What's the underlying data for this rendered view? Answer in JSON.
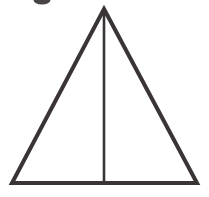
{
  "figure": {
    "title": "Isosceles triangle with vertical median line",
    "canvas": {
      "width": 209,
      "height": 197,
      "background_color": "#ffffff"
    },
    "stroke_color": "#3a3434",
    "shapes": {
      "triangle": {
        "name": "triangle-outline",
        "kind": "polygon",
        "points": "104,9 197,183 12,183",
        "stroke_width": 4,
        "fill": "none",
        "vertices": {
          "apex": {
            "x": 104,
            "y": 9
          },
          "bottom_right": {
            "x": 197,
            "y": 183
          },
          "bottom_left": {
            "x": 12,
            "y": 183
          }
        }
      },
      "median": {
        "name": "median-line",
        "kind": "line",
        "x1": 104,
        "y1": 10,
        "x2": 104,
        "y2": 182,
        "stroke_width": 2.6
      },
      "scan_artifact": {
        "name": "scan-artifact-blob",
        "kind": "ellipse",
        "cx": 42,
        "cy": 0,
        "rx": 8.5,
        "ry": 4.5,
        "fill": "#3a3434"
      }
    },
    "labels": {
      "alt_text": "A large isosceles triangle drawn in dark outline with a single vertical line from the top apex straight down to the middle of the base, splitting it into two right triangles."
    }
  }
}
